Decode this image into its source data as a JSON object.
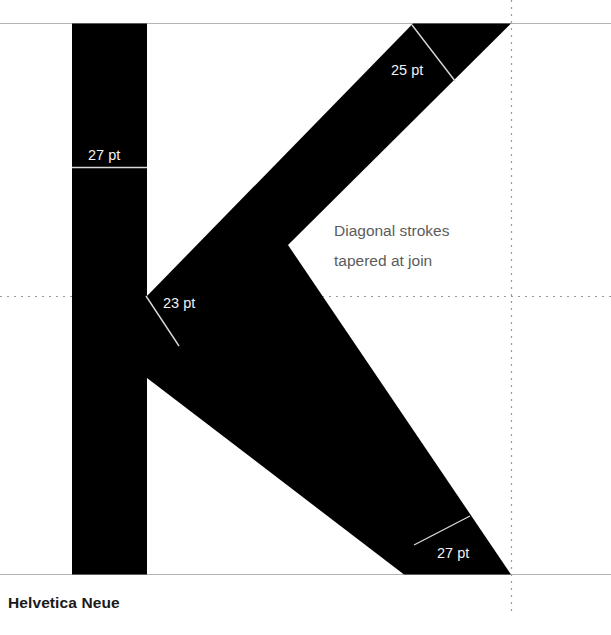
{
  "diagram": {
    "title": "Helvetica Neue",
    "glyph": "K",
    "annotation": {
      "line1": "Diagonal strokes",
      "line2": "tapered at join"
    },
    "measurements": [
      {
        "id": "stem-width",
        "label": "27 pt",
        "part": "vertical stem"
      },
      {
        "id": "upper-arm-width",
        "label": "25 pt",
        "part": "upper diagonal arm"
      },
      {
        "id": "join-taper-width",
        "label": "23 pt",
        "part": "taper at join"
      },
      {
        "id": "lower-leg-width",
        "label": "27 pt",
        "part": "lower diagonal leg"
      }
    ],
    "colors": {
      "glyph_fill": "#000000",
      "background": "#ffffff",
      "measure_text": "#f2f2f2",
      "measure_rule": "#d8d8d8",
      "note_text": "#5c5c5c",
      "guide_solid": "#b4b4b4",
      "guide_dotted": "#9a9a9a",
      "caption_text": "#1a1a1a"
    }
  }
}
